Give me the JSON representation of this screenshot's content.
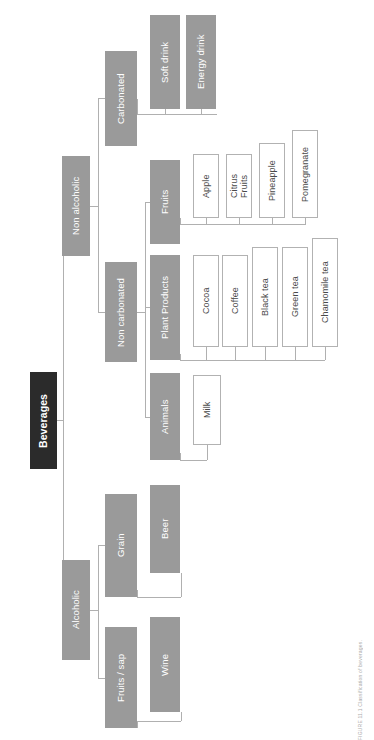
{
  "figure": {
    "title": "Beverages",
    "caption": "FIGURE 11.1  Classification of beverages.",
    "colors": {
      "root_fill": "#2b2b2b",
      "category_fill": "#9a9a9a",
      "leaf_fill": "#ffffff",
      "leaf_border": "#b2b2b2",
      "connector": "#b0b0b0",
      "root_text": "#ffffff",
      "category_text": "#ffffff",
      "leaf_text": "#4a4a4a"
    }
  },
  "nodes": {
    "root": {
      "label": "Beverages",
      "x": 30,
      "y": 372,
      "w": 27,
      "h": 97
    },
    "non_alcoholic": {
      "label": "Non alcoholic",
      "x": 62,
      "y": 156,
      "w": 28,
      "h": 100
    },
    "alcoholic": {
      "label": "Alcoholic",
      "x": 62,
      "y": 560,
      "w": 28,
      "h": 100
    },
    "carbonated": {
      "label": "Carbonated",
      "x": 105,
      "y": 51,
      "w": 32,
      "h": 95
    },
    "non_carbonated": {
      "label": "Non carbonated",
      "x": 105,
      "y": 262,
      "w": 32,
      "h": 100
    },
    "grain": {
      "label": "Grain",
      "x": 105,
      "y": 494,
      "w": 32,
      "h": 103
    },
    "fruits_sap": {
      "label": "Fruits / sap",
      "x": 105,
      "y": 627,
      "w": 32,
      "h": 101
    },
    "soft_drink": {
      "label": "Soft drink",
      "x": 150,
      "y": 15,
      "w": 30,
      "h": 94
    },
    "energy_drink": {
      "label": "Energy drink",
      "x": 186,
      "y": 15,
      "w": 30,
      "h": 94
    },
    "fruits": {
      "label": "Fruits",
      "x": 150,
      "y": 160,
      "w": 30,
      "h": 84
    },
    "plant_products": {
      "label": "Plant Products",
      "x": 150,
      "y": 255,
      "w": 30,
      "h": 105
    },
    "animals": {
      "label": "Animals",
      "x": 150,
      "y": 373,
      "w": 30,
      "h": 87
    },
    "beer": {
      "label": "Beer",
      "x": 150,
      "y": 485,
      "w": 30,
      "h": 88
    },
    "wine": {
      "label": "Wine",
      "x": 150,
      "y": 617,
      "w": 30,
      "h": 95
    },
    "apple": {
      "label": "Apple",
      "x": 193,
      "y": 154,
      "w": 26,
      "h": 64
    },
    "citrus_fruits": {
      "label": "Citrus\nFruits",
      "x": 226,
      "y": 154,
      "w": 26,
      "h": 64
    },
    "pineapple": {
      "label": "Pineapple",
      "x": 259,
      "y": 143,
      "w": 26,
      "h": 75
    },
    "pomegranate": {
      "label": "Pomegranate",
      "x": 292,
      "y": 130,
      "w": 26,
      "h": 88
    },
    "cocoa": {
      "label": "Cocoa",
      "x": 193,
      "y": 255,
      "w": 26,
      "h": 92
    },
    "coffee": {
      "label": "Coffee",
      "x": 222,
      "y": 255,
      "w": 26,
      "h": 92
    },
    "black_tea": {
      "label": "Black tea",
      "x": 252,
      "y": 247,
      "w": 26,
      "h": 100
    },
    "green_tea": {
      "label": "Green tea",
      "x": 282,
      "y": 247,
      "w": 26,
      "h": 100
    },
    "chamomile_tea": {
      "label": "Chamomile  tea",
      "x": 312,
      "y": 238,
      "w": 26,
      "h": 109
    },
    "milk": {
      "label": "Milk",
      "x": 193,
      "y": 375,
      "w": 28,
      "h": 70
    }
  },
  "hierarchy": {
    "name": "Beverages",
    "children": [
      {
        "name": "Non alcoholic",
        "children": [
          {
            "name": "Carbonated",
            "children": [
              {
                "name": "Soft drink"
              },
              {
                "name": "Energy drink"
              }
            ]
          },
          {
            "name": "Non carbonated",
            "children": [
              {
                "name": "Fruits",
                "children": [
                  {
                    "name": "Apple"
                  },
                  {
                    "name": "Citrus Fruits"
                  },
                  {
                    "name": "Pineapple"
                  },
                  {
                    "name": "Pomegranate"
                  }
                ]
              },
              {
                "name": "Plant Products",
                "children": [
                  {
                    "name": "Cocoa"
                  },
                  {
                    "name": "Coffee"
                  },
                  {
                    "name": "Black tea"
                  },
                  {
                    "name": "Green tea"
                  },
                  {
                    "name": "Chamomile tea"
                  }
                ]
              },
              {
                "name": "Animals",
                "children": [
                  {
                    "name": "Milk"
                  }
                ]
              }
            ]
          }
        ]
      },
      {
        "name": "Alcoholic",
        "children": [
          {
            "name": "Grain",
            "children": [
              {
                "name": "Beer"
              }
            ]
          },
          {
            "name": "Fruits / sap",
            "children": [
              {
                "name": "Wine"
              }
            ]
          }
        ]
      }
    ]
  }
}
